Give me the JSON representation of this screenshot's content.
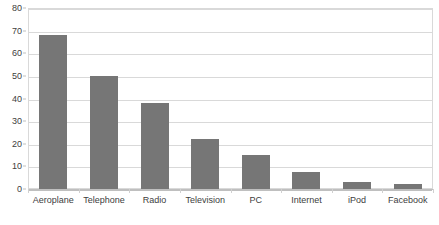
{
  "chart_data": {
    "type": "bar",
    "title": "",
    "subtitle": "",
    "xlabel": "",
    "ylabel": "",
    "categories": [
      "Aeroplane",
      "Telephone",
      "Radio",
      "Television",
      "PC",
      "Internet",
      "iPod",
      "Facebook"
    ],
    "values": [
      68,
      50,
      38,
      22,
      15,
      7.5,
      3,
      2
    ],
    "series": [
      {
        "name": "",
        "values": [
          68,
          50,
          38,
          22,
          15,
          7.5,
          3,
          2
        ]
      }
    ],
    "ylim": [
      0,
      80
    ],
    "y_ticks": [
      0,
      10,
      20,
      30,
      40,
      50,
      60,
      70,
      80
    ],
    "y_tick_labels": [
      "0",
      "10",
      "20",
      "30",
      "40",
      "50",
      "60",
      "70",
      "80"
    ],
    "grid": true,
    "grid_axis": "y",
    "legend": false,
    "legend_position": "none",
    "bar_color": "#767676",
    "grid_color": "#d9d9d9",
    "axis_color": "#bfbfbf",
    "text_color": "#404040",
    "background": "#ffffff"
  }
}
